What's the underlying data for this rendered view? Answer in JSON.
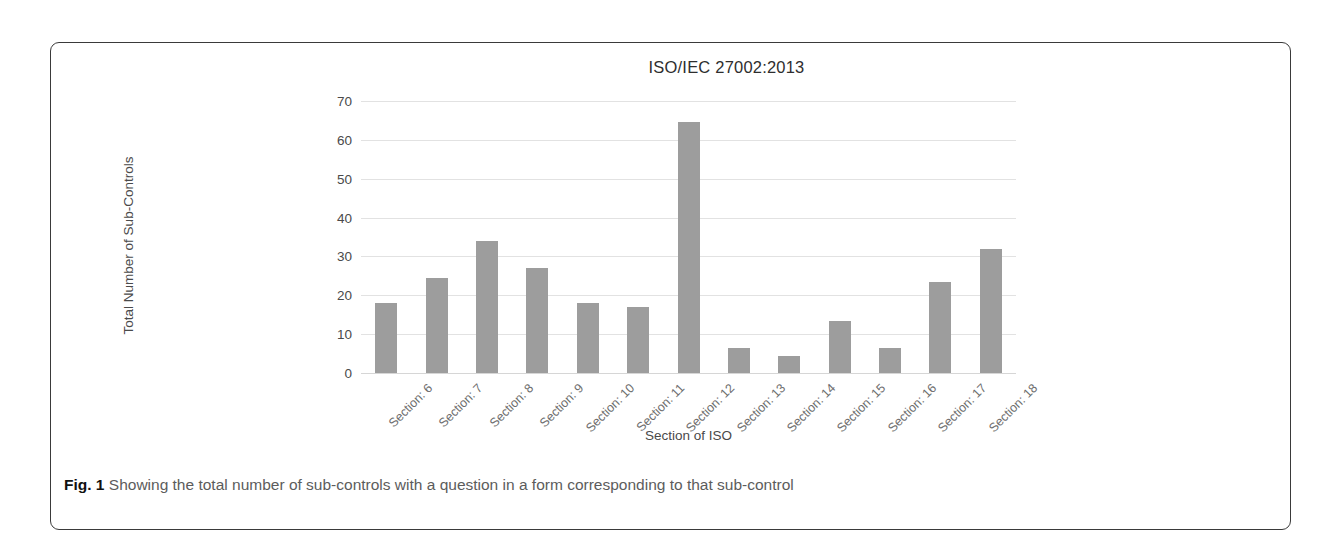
{
  "figure": {
    "caption_label": "Fig. 1",
    "caption_text": "Showing the total number of sub-controls with a question in a form corresponding to that sub-control"
  },
  "chart_data": {
    "type": "bar",
    "title": "ISO/IEC 27002:2013",
    "xlabel": "Section of ISO",
    "ylabel": "Total Number of Sub-Controls",
    "ylim": [
      0,
      70
    ],
    "ytick_step": 10,
    "yticks": [
      "70",
      "60",
      "50",
      "40",
      "30",
      "20",
      "10",
      "0"
    ],
    "grid": true,
    "legend": "none",
    "bar_color": "#9d9d9d",
    "categories": [
      "Section: 6",
      "Section: 7",
      "Section: 8",
      "Section: 9",
      "Section: 10",
      "Section: 11",
      "Section: 12",
      "Section: 13",
      "Section: 14",
      "Section: 15",
      "Section: 16",
      "Section: 17",
      "Section: 18"
    ],
    "values": [
      18,
      24.5,
      34,
      27,
      18,
      17,
      64.5,
      6.5,
      4.5,
      13.5,
      6.5,
      23.5,
      32
    ]
  }
}
